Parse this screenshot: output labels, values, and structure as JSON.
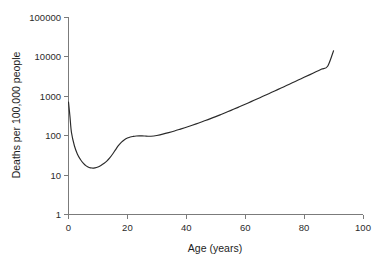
{
  "chart_data": {
    "type": "line",
    "title": "",
    "subtitle": "",
    "xlabel": "Age (years)",
    "ylabel": "Deaths per 100,000 people",
    "xlim": [
      0,
      100
    ],
    "ylim": [
      1,
      100000
    ],
    "yscale": "log",
    "xscale": "linear",
    "grid": false,
    "legend": false,
    "legend_position": "none",
    "xticks": [
      0,
      20,
      40,
      60,
      80,
      100
    ],
    "xtick_labels": [
      "0",
      "20",
      "40",
      "60",
      "80",
      "100"
    ],
    "yticks": [
      1,
      10,
      100,
      1000,
      10000,
      100000
    ],
    "ytick_labels": [
      "1",
      "10",
      "100",
      "1000",
      "10000",
      "100000"
    ],
    "series": [
      {
        "name": "Mortality rate",
        "color": "#2a2a2a",
        "x": [
          0,
          0.5,
          1,
          2,
          3,
          4,
          5,
          6,
          7,
          8,
          9,
          10,
          11,
          12,
          13,
          14,
          15,
          16,
          17,
          18,
          19,
          20,
          21,
          22,
          23,
          24,
          25,
          26,
          27,
          28,
          29,
          30,
          32,
          34,
          36,
          38,
          40,
          42,
          44,
          46,
          48,
          50,
          52,
          54,
          56,
          58,
          60,
          62,
          64,
          66,
          68,
          70,
          72,
          74,
          76,
          78,
          80,
          82,
          84,
          86,
          88,
          90
        ],
        "y": [
          700,
          300,
          120,
          55,
          34,
          25,
          20,
          17,
          15.5,
          15,
          15.2,
          16,
          17.5,
          19.5,
          22.5,
          27,
          34,
          44,
          56,
          68,
          78,
          86,
          92,
          95,
          97,
          98,
          98,
          97,
          96,
          96,
          97,
          100,
          108,
          118,
          130,
          145,
          162,
          182,
          205,
          232,
          263,
          300,
          345,
          398,
          460,
          532,
          618,
          720,
          840,
          980,
          1145,
          1340,
          1570,
          1840,
          2160,
          2530,
          2970,
          3480,
          4090,
          4800,
          5650,
          14000
        ]
      }
    ],
    "annotations": []
  },
  "axes": {
    "x_title": "Age (years)",
    "y_title": "Deaths per 100,000 people"
  }
}
